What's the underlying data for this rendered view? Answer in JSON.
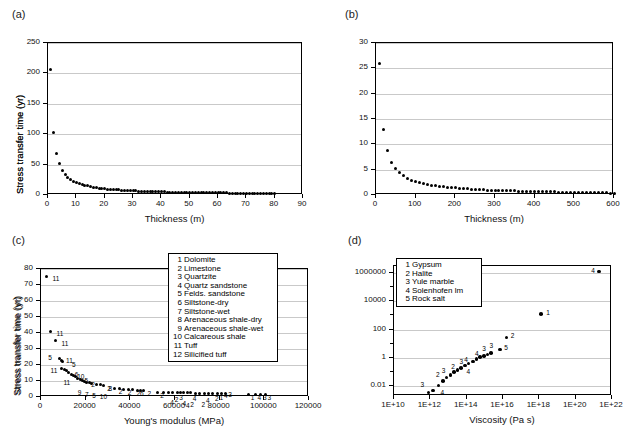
{
  "figure": {
    "panels": [
      "a",
      "b",
      "c",
      "d"
    ],
    "background": "#ffffff",
    "marker_color": "#000000",
    "grid_color": "#c9c9c9"
  },
  "panel_a": {
    "label": "(a)"
  },
  "panel_b": {
    "label": "(b)"
  },
  "panel_c": {
    "label": "(c)"
  },
  "panel_d": {
    "label": "(d)"
  },
  "chart_data": [
    {
      "panel": "a",
      "type": "scatter",
      "title": "",
      "xlabel": "Thickness (m)",
      "ylabel": "Stress transfer time (yr)",
      "xlim": [
        0,
        90
      ],
      "ylim": [
        0,
        250
      ],
      "xticks": [
        0,
        10,
        20,
        30,
        40,
        50,
        60,
        70,
        80,
        90
      ],
      "yticks": [
        0,
        50,
        100,
        150,
        200,
        250
      ],
      "grid": true,
      "legend": "none",
      "x": [
        1,
        2,
        3,
        4,
        5,
        6,
        7,
        8,
        9,
        10,
        11,
        12,
        13,
        14,
        15,
        16,
        17,
        18,
        19,
        20,
        21,
        22,
        23,
        24,
        25,
        26,
        27,
        28,
        29,
        30,
        31,
        32,
        33,
        34,
        35,
        36,
        37,
        38,
        39,
        40,
        41,
        42,
        43,
        44,
        45,
        46,
        47,
        48,
        49,
        50,
        51,
        52,
        53,
        54,
        55,
        56,
        57,
        58,
        59,
        60,
        61,
        62,
        63,
        64,
        65,
        66,
        67,
        68,
        69,
        70,
        71,
        72,
        73,
        74,
        75,
        76,
        77,
        78,
        79,
        80
      ],
      "y": [
        207,
        103,
        69,
        52,
        41,
        34,
        29,
        26,
        23,
        21,
        19,
        17,
        16,
        15,
        14,
        13,
        12,
        11.5,
        11,
        10,
        9.7,
        9.3,
        9,
        8.6,
        8.3,
        8,
        7.7,
        7.4,
        7.1,
        6.9,
        6.7,
        6.5,
        6.3,
        6.1,
        5.9,
        5.7,
        5.6,
        5.4,
        5.3,
        5.2,
        5,
        4.9,
        4.8,
        4.7,
        4.6,
        4.5,
        4.4,
        4.3,
        4.2,
        4.1,
        4,
        3.9,
        3.9,
        3.8,
        3.7,
        3.7,
        3.6,
        3.5,
        3.5,
        3.4,
        3.4,
        3.3,
        3.3,
        3.2,
        3.2,
        3.1,
        3.1,
        3,
        3,
        2.9,
        2.9,
        2.8,
        2.8,
        2.8,
        2.7,
        2.7,
        2.7,
        2.6,
        2.6,
        2.6
      ]
    },
    {
      "panel": "b",
      "type": "scatter",
      "title": "",
      "xlabel": "Thickness (m)",
      "ylabel": "Stress transfer time (yr)",
      "xlim": [
        0,
        600
      ],
      "ylim": [
        0,
        30
      ],
      "xticks": [
        0,
        100,
        200,
        300,
        400,
        500,
        600
      ],
      "yticks": [
        0,
        5,
        10,
        15,
        20,
        25,
        30
      ],
      "grid": true,
      "legend": "none",
      "x": [
        10,
        20,
        30,
        40,
        50,
        60,
        70,
        80,
        90,
        100,
        110,
        120,
        130,
        140,
        150,
        160,
        170,
        180,
        190,
        200,
        210,
        220,
        230,
        240,
        250,
        260,
        270,
        280,
        290,
        300,
        310,
        320,
        330,
        340,
        350,
        360,
        370,
        380,
        390,
        400,
        410,
        420,
        430,
        440,
        450,
        460,
        470,
        480,
        490,
        500,
        510,
        520,
        530,
        540,
        550,
        560,
        570,
        580,
        590,
        600
      ],
      "y": [
        26,
        13,
        8.7,
        6.5,
        5.2,
        4.4,
        3.8,
        3.3,
        2.9,
        2.7,
        2.4,
        2.2,
        2.1,
        1.9,
        1.8,
        1.7,
        1.6,
        1.5,
        1.45,
        1.4,
        1.3,
        1.25,
        1.2,
        1.15,
        1.1,
        1.05,
        1.0,
        0.98,
        0.95,
        0.92,
        0.9,
        0.87,
        0.85,
        0.82,
        0.8,
        0.78,
        0.76,
        0.74,
        0.72,
        0.7,
        0.68,
        0.66,
        0.64,
        0.62,
        0.6,
        0.58,
        0.56,
        0.55,
        0.53,
        0.52,
        0.5,
        0.49,
        0.47,
        0.46,
        0.44,
        0.43,
        0.41,
        0.4,
        0.38,
        0.36
      ]
    },
    {
      "panel": "c",
      "type": "scatter",
      "title": "",
      "xlabel": "Young's modulus (MPa)",
      "ylabel": "Stress transfer time (yr)",
      "xlim": [
        0,
        120000
      ],
      "ylim": [
        0,
        80
      ],
      "xticks": [
        0,
        20000,
        40000,
        60000,
        80000,
        100000,
        120000
      ],
      "yticks": [
        0,
        10,
        20,
        30,
        40,
        50,
        60,
        70,
        80
      ],
      "grid": true,
      "legend_position": "top-right",
      "legend": [
        {
          "num": "1",
          "label": "Dolomite"
        },
        {
          "num": "2",
          "label": "Limestone"
        },
        {
          "num": "3",
          "label": "Quartzite"
        },
        {
          "num": "4",
          "label": "Quartz sandstone"
        },
        {
          "num": "5",
          "label": "Felds. sandstone"
        },
        {
          "num": "6",
          "label": "Siltstone-dry"
        },
        {
          "num": "7",
          "label": "Siltstone-wet"
        },
        {
          "num": "8",
          "label": "Arenaceous shale-dry"
        },
        {
          "num": "9",
          "label": "Arenaceous shale-wet"
        },
        {
          "num": "10",
          "label": "Calcareous shale"
        },
        {
          "num": "11",
          "label": "Tuff"
        },
        {
          "num": "12",
          "label": "Silicified tuff"
        }
      ],
      "points": [
        {
          "x": 2500,
          "y": 75.5,
          "tag": "11",
          "tx": 6,
          "ty": 2
        },
        {
          "x": 4300,
          "y": 41.0,
          "tag": "11",
          "tx": 6,
          "ty": 2
        },
        {
          "x": 6500,
          "y": 35.2,
          "tag": "11",
          "tx": 6,
          "ty": 2
        },
        {
          "x": 8200,
          "y": 24.0,
          "tag": "5",
          "tx": -11,
          "ty": -2
        },
        {
          "x": 9000,
          "y": 23.0,
          "tag": "11",
          "tx": 5,
          "ty": 0
        },
        {
          "x": 9800,
          "y": 22.0,
          "tag": "5",
          "tx": 9,
          "ty": 2
        },
        {
          "x": 9200,
          "y": 18.0,
          "tag": "11",
          "tx": -11,
          "ty": 2
        },
        {
          "x": 10500,
          "y": 17.2,
          "tag": "",
          "tx": 0,
          "ty": 0
        },
        {
          "x": 11500,
          "y": 16.3,
          "tag": "6",
          "tx": 8,
          "ty": 3
        },
        {
          "x": 12500,
          "y": 15.2,
          "tag": "",
          "tx": 0,
          "ty": 0
        },
        {
          "x": 13500,
          "y": 14.3,
          "tag": "10",
          "tx": 6,
          "ty": 2
        },
        {
          "x": 14500,
          "y": 13.4,
          "tag": "11",
          "tx": -10,
          "ty": 6
        },
        {
          "x": 15500,
          "y": 12.6,
          "tag": "5",
          "tx": 9,
          "ty": 3
        },
        {
          "x": 16500,
          "y": 11.8,
          "tag": "",
          "tx": 0,
          "ty": 0
        },
        {
          "x": 17500,
          "y": 11.0,
          "tag": "",
          "tx": 0,
          "ty": 0
        },
        {
          "x": 18500,
          "y": 10.4,
          "tag": "2",
          "tx": 9,
          "ty": 4
        },
        {
          "x": 19500,
          "y": 9.8,
          "tag": "",
          "tx": 0,
          "ty": 0
        },
        {
          "x": 20500,
          "y": 9.2,
          "tag": "9",
          "tx": -9,
          "ty": 10
        },
        {
          "x": 21500,
          "y": 8.8,
          "tag": "7",
          "tx": -4,
          "ty": 11
        },
        {
          "x": 22500,
          "y": 8.4,
          "tag": "5",
          "tx": 1,
          "ty": 11
        },
        {
          "x": 25000,
          "y": 7.8,
          "tag": "10",
          "tx": 3,
          "ty": 11
        },
        {
          "x": 26500,
          "y": 7.6,
          "tag": "2",
          "tx": 7,
          "ty": 3
        },
        {
          "x": 28000,
          "y": 7.3,
          "tag": "8",
          "tx": 5,
          "ty": 3
        },
        {
          "x": 33000,
          "y": 5.4,
          "tag": "2",
          "tx": 4,
          "ty": 3
        },
        {
          "x": 35000,
          "y": 5.2,
          "tag": "",
          "tx": 0,
          "ty": 0
        },
        {
          "x": 37000,
          "y": 5.0,
          "tag": "2",
          "tx": 4,
          "ty": 3
        },
        {
          "x": 39000,
          "y": 4.8,
          "tag": "",
          "tx": 0,
          "ty": 0
        },
        {
          "x": 41000,
          "y": 4.5,
          "tag": "2",
          "tx": 4,
          "ty": 3
        },
        {
          "x": 43000,
          "y": 4.3,
          "tag": "6",
          "tx": 3,
          "ty": 3
        },
        {
          "x": 44500,
          "y": 4.2,
          "tag": "2",
          "tx": 7,
          "ty": 3
        },
        {
          "x": 46000,
          "y": 4.0,
          "tag": "",
          "tx": 0,
          "ty": 0
        },
        {
          "x": 52000,
          "y": 3.0,
          "tag": "2",
          "tx": 3,
          "ty": 3
        },
        {
          "x": 55000,
          "y": 2.9,
          "tag": "",
          "tx": 0,
          "ty": 0
        },
        {
          "x": 57000,
          "y": 2.9,
          "tag": "4",
          "tx": 2,
          "ty": 10
        },
        {
          "x": 59000,
          "y": 2.8,
          "tag": "2",
          "tx": 2,
          "ty": 6
        },
        {
          "x": 61000,
          "y": 2.8,
          "tag": "3",
          "tx": 2,
          "ty": 4
        },
        {
          "x": 62500,
          "y": 2.7,
          "tag": "4",
          "tx": 2,
          "ty": 10
        },
        {
          "x": 64000,
          "y": 2.7,
          "tag": "4",
          "tx": 2,
          "ty": 12
        },
        {
          "x": 65500,
          "y": 2.6,
          "tag": "2",
          "tx": 3,
          "ty": 11
        },
        {
          "x": 67000,
          "y": 2.6,
          "tag": "4",
          "tx": 2,
          "ty": 5
        },
        {
          "x": 69000,
          "y": 2.5,
          "tag": "",
          "tx": 0,
          "ty": 0
        },
        {
          "x": 71000,
          "y": 2.5,
          "tag": "2",
          "tx": 2,
          "ty": 11
        },
        {
          "x": 73000,
          "y": 2.4,
          "tag": "4",
          "tx": 2,
          "ty": 7
        },
        {
          "x": 75000,
          "y": 2.4,
          "tag": "",
          "tx": 0,
          "ty": 0
        },
        {
          "x": 77000,
          "y": 2.3,
          "tag": "2",
          "tx": 2,
          "ty": 5
        },
        {
          "x": 79000,
          "y": 2.3,
          "tag": "1",
          "tx": 2,
          "ty": 4
        },
        {
          "x": 81000,
          "y": 2.2,
          "tag": "4",
          "tx": 2,
          "ty": 2
        },
        {
          "x": 82500,
          "y": 2.2,
          "tag": "3",
          "tx": 3,
          "ty": 1
        },
        {
          "x": 93000,
          "y": 1.8,
          "tag": "1",
          "tx": 2,
          "ty": 3
        },
        {
          "x": 96000,
          "y": 1.8,
          "tag": "4",
          "tx": 2,
          "ty": 3
        },
        {
          "x": 98500,
          "y": 1.7,
          "tag": "3",
          "tx": 2,
          "ty": 3
        },
        {
          "x": 100500,
          "y": 1.7,
          "tag": "3",
          "tx": 2,
          "ty": 3
        }
      ]
    },
    {
      "panel": "d",
      "type": "scatter",
      "title": "",
      "xlabel": "Viscosity (Pa s)",
      "ylabel": "Stress transfer time (yr)",
      "xscale": "log",
      "yscale": "log",
      "xlim_exp": [
        10,
        22
      ],
      "ylim_exp": [
        -2.7,
        6.5
      ],
      "xticks": [
        "1E+10",
        "1E+12",
        "1E+14",
        "1E+16",
        "1E+18",
        "1E+20",
        "1E+22"
      ],
      "yticks": [
        "0.01",
        "1",
        "100",
        "10000",
        "1000000"
      ],
      "grid": true,
      "legend_position": "top-left",
      "legend": [
        {
          "num": "1",
          "label": "Gypsum"
        },
        {
          "num": "2",
          "label": "Halite"
        },
        {
          "num": "3",
          "label": "Yule marble"
        },
        {
          "num": "4",
          "label": "Solenhofen lm"
        },
        {
          "num": "5",
          "label": "Rock salt"
        }
      ],
      "points": [
        {
          "xe": 11.9,
          "ye": -2.45,
          "tag": "3",
          "tx": -8,
          "ty": -7
        },
        {
          "xe": 12.15,
          "ye": -2.3,
          "tag": "",
          "tx": 0,
          "ty": 0
        },
        {
          "xe": 12.45,
          "ye": -1.95,
          "tag": "4",
          "tx": 2,
          "ty": 8
        },
        {
          "xe": 12.7,
          "ye": -1.65,
          "tag": "2",
          "tx": -7,
          "ty": -6
        },
        {
          "xe": 12.9,
          "ye": -1.4,
          "tag": "3",
          "tx": -5,
          "ty": -7
        },
        {
          "xe": 13.1,
          "ye": -1.2,
          "tag": "2",
          "tx": 1,
          "ty": -8
        },
        {
          "xe": 13.3,
          "ye": -1.0,
          "tag": "",
          "tx": 0,
          "ty": 0
        },
        {
          "xe": 13.5,
          "ye": -0.85,
          "tag": "3",
          "tx": 2,
          "ty": -8
        },
        {
          "xe": 13.7,
          "ye": -0.7,
          "tag": "4",
          "tx": 3,
          "ty": -8
        },
        {
          "xe": 13.9,
          "ye": -0.55,
          "tag": "",
          "tx": 0,
          "ty": 0
        },
        {
          "xe": 14.1,
          "ye": -0.4,
          "tag": "4",
          "tx": -2,
          "ty": 8
        },
        {
          "xe": 14.35,
          "ye": -0.25,
          "tag": "4",
          "tx": 2,
          "ty": -7
        },
        {
          "xe": 14.55,
          "ye": -0.1,
          "tag": "",
          "tx": 0,
          "ty": 0
        },
        {
          "xe": 14.75,
          "ye": 0.05,
          "tag": "3",
          "tx": 2,
          "ty": -8
        },
        {
          "xe": 14.95,
          "ye": 0.15,
          "tag": "",
          "tx": 0,
          "ty": 0
        },
        {
          "xe": 15.15,
          "ye": 0.25,
          "tag": "3",
          "tx": 2,
          "ty": -8
        },
        {
          "xe": 15.35,
          "ye": 0.35,
          "tag": "",
          "tx": 0,
          "ty": 0
        },
        {
          "xe": 15.85,
          "ye": 0.6,
          "tag": "5",
          "tx": 4,
          "ty": -1
        },
        {
          "xe": 16.2,
          "ye": 1.45,
          "tag": "2",
          "tx": 4,
          "ty": -1
        },
        {
          "xe": 18.1,
          "ye": 3.1,
          "tag": "1",
          "tx": 5,
          "ty": -1
        },
        {
          "xe": 21.3,
          "ye": 6.1,
          "tag": "4",
          "tx": -8,
          "ty": -1
        }
      ]
    }
  ]
}
